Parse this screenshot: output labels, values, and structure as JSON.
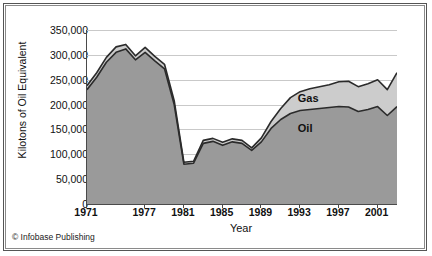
{
  "chart_data": {
    "type": "area",
    "stacked": true,
    "title": "",
    "xlabel": "Year",
    "ylabel": "Kilotons of Oil Equivalent",
    "xlim": [
      1971,
      2003
    ],
    "ylim": [
      0,
      350000
    ],
    "ytick_labels": [
      "350,000",
      "300,000",
      "250,000",
      "200,000",
      "150,000",
      "100,000",
      "50,000",
      "0"
    ],
    "ytick_values": [
      350000,
      300000,
      250000,
      200000,
      150000,
      100000,
      50000,
      0
    ],
    "xtick_labels": [
      "1971",
      "1977",
      "1981",
      "1985",
      "1989",
      "1993",
      "1997",
      "2001"
    ],
    "xtick_values": [
      1971,
      1977,
      1981,
      1985,
      1989,
      1993,
      1997,
      2001
    ],
    "grid": true,
    "legend_position": "inline",
    "x": [
      1971,
      1972,
      1973,
      1974,
      1975,
      1976,
      1977,
      1978,
      1979,
      1980,
      1981,
      1982,
      1983,
      1984,
      1985,
      1986,
      1987,
      1988,
      1989,
      1990,
      1991,
      1992,
      1993,
      1994,
      1995,
      1996,
      1997,
      1998,
      1999,
      2000,
      2001,
      2002,
      2003
    ],
    "series": [
      {
        "name": "Oil",
        "color": "#9a9a9a",
        "values": [
          230000,
          255000,
          285000,
          305000,
          312000,
          290000,
          305000,
          288000,
          272000,
          200000,
          80000,
          82000,
          122000,
          126000,
          118000,
          125000,
          122000,
          108000,
          125000,
          152000,
          170000,
          182000,
          188000,
          190000,
          192000,
          194000,
          196000,
          195000,
          186000,
          190000,
          196000,
          178000,
          196000
        ]
      },
      {
        "name": "Gas",
        "color": "#cccccc",
        "values": [
          8000,
          9000,
          10000,
          11000,
          9000,
          8000,
          10000,
          9000,
          9000,
          8000,
          4000,
          4000,
          6000,
          6000,
          6000,
          6000,
          6000,
          5000,
          8000,
          14000,
          22000,
          32000,
          38000,
          42000,
          44000,
          46000,
          50000,
          52000,
          50000,
          52000,
          54000,
          52000,
          68000
        ]
      }
    ],
    "totals": [
      238000,
      264000,
      295000,
      316000,
      321000,
      298000,
      315000,
      297000,
      281000,
      208000,
      84000,
      86000,
      128000,
      132000,
      124000,
      131000,
      128000,
      113000,
      133000,
      166000,
      192000,
      214000,
      226000,
      232000,
      236000,
      240000,
      246000,
      247000,
      236000,
      242000,
      250000,
      230000,
      264000
    ],
    "annotations": [
      {
        "text": "Gas",
        "x": 1994,
        "y": 212000
      },
      {
        "text": "Oil",
        "x": 1994,
        "y": 150000
      }
    ]
  },
  "credit": "© Infobase Publishing"
}
